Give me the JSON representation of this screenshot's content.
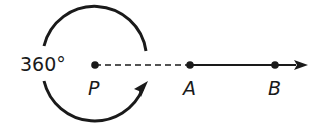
{
  "diagram": {
    "type": "geometry-rotation",
    "angle_label": "360°",
    "points": [
      {
        "id": "P",
        "label": "P",
        "x": 95,
        "y": 65
      },
      {
        "id": "A",
        "label": "A",
        "x": 190,
        "y": 65
      },
      {
        "id": "B",
        "label": "B",
        "x": 275,
        "y": 65
      }
    ],
    "segments": [
      {
        "from": "P",
        "to": "A",
        "style": "dashed"
      },
      {
        "from": "A",
        "to": "B",
        "style": "solid",
        "continues_as_ray": true
      }
    ],
    "arc": {
      "center": "P",
      "direction": "counterclockwise-full-turn",
      "has_arrowhead": true
    },
    "colors": {
      "stroke": "#1a1a1a",
      "background": "#ffffff"
    }
  }
}
